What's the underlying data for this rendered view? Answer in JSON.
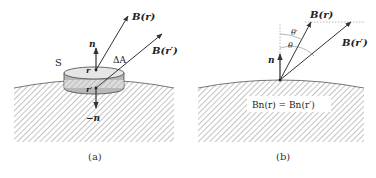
{
  "panels": [
    {
      "id": "a",
      "caption": "(a)",
      "labels": {
        "surface": "S",
        "area": "ΔA",
        "normal_up": "n",
        "normal_down": "−n",
        "point_top": "r",
        "point_bottom": "r′",
        "field_top": "B(r)",
        "field_bottom": "B(r′)"
      }
    },
    {
      "id": "b",
      "caption": "(b)",
      "labels": {
        "normal": "n",
        "field_r": "B(r)",
        "field_rp": "B(r′)",
        "angle_theta": "θ",
        "angle_theta_prime": "θ′",
        "equation": "Bn(r) = Bn(r′)"
      }
    }
  ],
  "colors": {
    "stroke": "#333333",
    "hatch": "#9a9a9a",
    "disk_top": "#e6e6e6",
    "disk_side": "#b8b8b8"
  }
}
